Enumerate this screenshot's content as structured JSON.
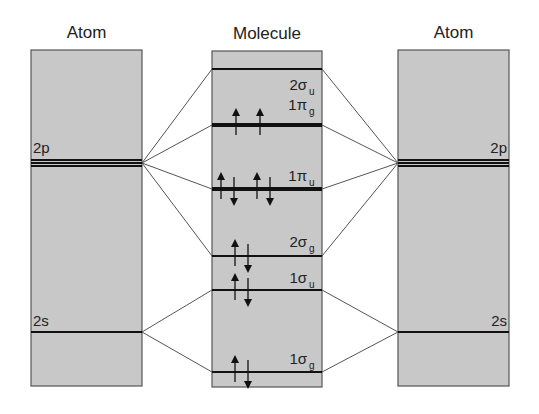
{
  "colors": {
    "panel_fill": "#c8c8c8",
    "panel_stroke": "#555555",
    "level_line": "#111111",
    "connector": "#555555",
    "arrow": "#111111",
    "text": "#222222"
  },
  "columns": {
    "left": {
      "title": "Atom",
      "x": 31,
      "y": 50,
      "w": 111,
      "h": 336
    },
    "middle": {
      "title": "Molecule",
      "x": 212,
      "y": 51,
      "w": 110,
      "h": 336
    },
    "right": {
      "title": "Atom",
      "x": 398,
      "y": 50,
      "w": 111,
      "h": 336
    }
  },
  "atomic_levels": {
    "left": [
      {
        "name": "2p",
        "label": "2p",
        "lines_y": [
          160,
          163,
          166
        ],
        "label_x": 33,
        "label_y": 153,
        "anchor": "start"
      },
      {
        "name": "2s",
        "label": "2s",
        "lines_y": [
          332
        ],
        "label_x": 33,
        "label_y": 326,
        "anchor": "start"
      }
    ],
    "right": [
      {
        "name": "2p",
        "label": "2p",
        "lines_y": [
          160,
          163,
          166
        ],
        "label_x": 507,
        "label_y": 153,
        "anchor": "end"
      },
      {
        "name": "2s",
        "label": "2s",
        "lines_y": [
          332
        ],
        "label_x": 507,
        "label_y": 326,
        "anchor": "end"
      }
    ]
  },
  "molecular_orbitals": [
    {
      "name": "2sigma_u",
      "num": "2",
      "sym": "σ",
      "sub": "u",
      "y": 69,
      "thick": 2,
      "label_y": 90,
      "electrons": []
    },
    {
      "name": "1pi_g",
      "num": "1",
      "sym": "π",
      "sub": "g",
      "y": 125,
      "thick": 4,
      "label_y": 110,
      "electrons": [
        {
          "x": 236,
          "dir": "up"
        },
        {
          "x": 260,
          "dir": "up"
        }
      ]
    },
    {
      "name": "1pi_u",
      "num": "1",
      "sym": "π",
      "sub": "u",
      "y": 189,
      "thick": 4,
      "label_y": 181,
      "electrons": [
        {
          "x": 221,
          "dir": "up"
        },
        {
          "x": 234,
          "dir": "down"
        },
        {
          "x": 257,
          "dir": "up"
        },
        {
          "x": 270,
          "dir": "down"
        }
      ]
    },
    {
      "name": "2sigma_g",
      "num": "2",
      "sym": "σ",
      "sub": "g",
      "y": 256,
      "thick": 2,
      "label_y": 247,
      "electrons": [
        {
          "x": 235,
          "dir": "up"
        },
        {
          "x": 248,
          "dir": "down"
        }
      ]
    },
    {
      "name": "1sigma_u",
      "num": "1",
      "sym": "σ",
      "sub": "u",
      "y": 290,
      "thick": 2,
      "label_y": 283,
      "electrons": [
        {
          "x": 235,
          "dir": "up"
        },
        {
          "x": 248,
          "dir": "down"
        }
      ]
    },
    {
      "name": "1sigma_g",
      "num": "1",
      "sym": "σ",
      "sub": "g",
      "y": 372,
      "thick": 2,
      "label_y": 364,
      "electrons": [
        {
          "x": 235,
          "dir": "up"
        },
        {
          "x": 248,
          "dir": "down"
        }
      ]
    }
  ],
  "connectors": {
    "2p": {
      "atom_y": 163,
      "targets": [
        "2sigma_u",
        "1pi_g",
        "1pi_u",
        "2sigma_g"
      ]
    },
    "2s": {
      "atom_y": 332,
      "targets": [
        "1sigma_u",
        "1sigma_g"
      ]
    }
  }
}
